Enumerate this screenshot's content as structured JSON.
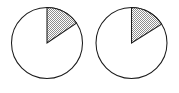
{
  "figure": {
    "name": "two-pie-charts",
    "background_color": "#ffffff",
    "outline_color": "#1a1a1a",
    "sector_fill_color": "#b7b7b7",
    "sector_fill_pattern": "stipple-dots",
    "canvas": {
      "width": 179,
      "height": 93
    }
  },
  "chart_data": [
    {
      "type": "pie",
      "name": "left-pie-chart",
      "title": "",
      "xlabel": "",
      "ylabel": "",
      "legend": "none",
      "grid": false,
      "center": {
        "x": 47,
        "y": 43
      },
      "radius": 35.5,
      "start_angle_deg": 0,
      "rotation": "clockwise-from-12-oclock",
      "categories": [
        "shaded-sector",
        "unshaded-remainder"
      ],
      "values": [
        56,
        304
      ],
      "values_unit": "degrees",
      "percentages": [
        15.6,
        84.4
      ],
      "slices": [
        {
          "label": "shaded-sector",
          "angle_deg": 56,
          "start_deg": 0,
          "end_deg": 56,
          "percent": 15.6,
          "fill": "#b7b7b7",
          "pattern": "stipple-dots"
        },
        {
          "label": "unshaded-remainder",
          "angle_deg": 304,
          "start_deg": 56,
          "end_deg": 360,
          "percent": 84.4,
          "fill": "#ffffff",
          "pattern": "none"
        }
      ]
    },
    {
      "type": "pie",
      "name": "right-pie-chart",
      "title": "",
      "xlabel": "",
      "ylabel": "",
      "legend": "none",
      "grid": false,
      "center": {
        "x": 131.5,
        "y": 43
      },
      "radius": 35.5,
      "start_angle_deg": 0,
      "rotation": "clockwise-from-12-oclock",
      "categories": [
        "shaded-sector",
        "unshaded-remainder"
      ],
      "values": [
        58,
        302
      ],
      "values_unit": "degrees",
      "percentages": [
        16.1,
        83.9
      ],
      "slices": [
        {
          "label": "shaded-sector",
          "angle_deg": 58,
          "start_deg": 0,
          "end_deg": 58,
          "percent": 16.1,
          "fill": "#b7b7b7",
          "pattern": "stipple-dots"
        },
        {
          "label": "unshaded-remainder",
          "angle_deg": 302,
          "start_deg": 58,
          "end_deg": 360,
          "percent": 83.9,
          "fill": "#ffffff",
          "pattern": "none"
        }
      ]
    }
  ]
}
